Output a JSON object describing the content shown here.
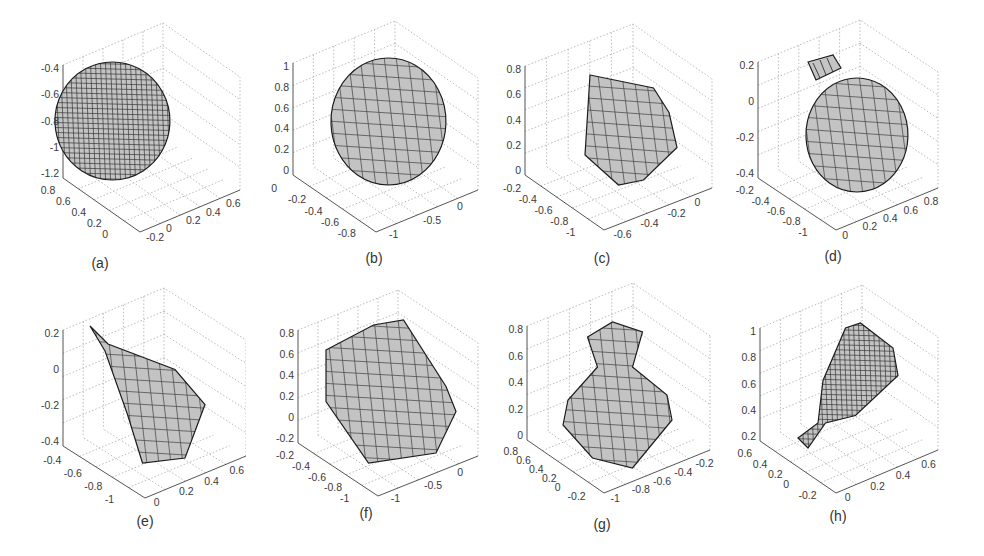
{
  "figure": {
    "panels": [
      {
        "id": "a",
        "caption": "(a)",
        "shape": "dense-wireframe-sphere",
        "z_ticks": [
          "-0.4",
          "-0.6",
          "-0.8",
          "-1",
          "-1.2"
        ],
        "y_ticks": [
          "0.8",
          "0.6",
          "0.4",
          "0.2",
          "0"
        ],
        "x_ticks": [
          "-0.2",
          "0",
          "0.2",
          "0.4",
          "0.6"
        ]
      },
      {
        "id": "b",
        "caption": "(b)",
        "shape": "mesh-sphere",
        "z_ticks": [
          "1",
          "0.8",
          "0.6",
          "0.4",
          "0.2",
          "0"
        ],
        "y_ticks": [
          "0",
          "-0.2",
          "-0.4",
          "-0.6",
          "-0.8"
        ],
        "x_ticks": [
          "-1",
          "-0.5",
          "0"
        ]
      },
      {
        "id": "c",
        "caption": "(c)",
        "shape": "mesh-cone",
        "z_ticks": [
          "0.8",
          "0.6",
          "0.4",
          "0.2",
          "0"
        ],
        "y_ticks": [
          "-0.2",
          "-0.4",
          "-0.6",
          "-0.8",
          "-1"
        ],
        "x_ticks": [
          "-0.6",
          "-0.4",
          "-0.2",
          "0"
        ]
      },
      {
        "id": "d",
        "caption": "(d)",
        "shape": "mesh-egg-detached-cap",
        "z_ticks": [
          "0.2",
          "0",
          "-0.2",
          "-0.4"
        ],
        "y_ticks": [
          "-0.2",
          "-0.4",
          "-0.6",
          "-0.8",
          "-1"
        ],
        "x_ticks": [
          "0",
          "0.2",
          "0.4",
          "0.6",
          "0.8"
        ]
      },
      {
        "id": "e",
        "caption": "(e)",
        "shape": "mesh-teardrop",
        "z_ticks": [
          "0.2",
          "0",
          "-0.2",
          "-0.4"
        ],
        "y_ticks": [
          "-0.4",
          "-0.6",
          "-0.8",
          "-1"
        ],
        "x_ticks": [
          "0",
          "0.2",
          "0.4",
          "0.6"
        ]
      },
      {
        "id": "f",
        "caption": "(f)",
        "shape": "mesh-cylinder",
        "z_ticks": [
          "0.8",
          "0.6",
          "0.4",
          "0.2",
          "0",
          "-0.2"
        ],
        "y_ticks": [
          "-0.2",
          "-0.4",
          "-0.6",
          "-0.8",
          "-1"
        ],
        "x_ticks": [
          "-1",
          "-0.5",
          "0"
        ]
      },
      {
        "id": "g",
        "caption": "(g)",
        "shape": "mesh-vase",
        "z_ticks": [
          "0.8",
          "0.6",
          "0.4",
          "0.2",
          "0"
        ],
        "y_ticks": [
          "0.8",
          "0.6",
          "0.4",
          "0.2",
          "0",
          "-0.2"
        ],
        "x_ticks": [
          "-1",
          "-0.8",
          "-0.6",
          "-0.4",
          "-0.2"
        ]
      },
      {
        "id": "h",
        "caption": "(h)",
        "shape": "wireframe-pear",
        "z_ticks": [
          "1",
          "0.8",
          "0.6",
          "0.4",
          "0.2"
        ],
        "y_ticks": [
          "0.6",
          "0.4",
          "0.2",
          "0",
          "-0.2"
        ],
        "x_ticks": [
          "0",
          "0.2",
          "0.4",
          "0.6"
        ]
      }
    ],
    "colors": {
      "mesh_fill": "#c4c4c4",
      "mesh_edge": "#1e1e1e",
      "axis": "#555555",
      "grid": "#bbbbbb"
    }
  },
  "chart_data": [
    {
      "type": "surface-3d",
      "title": "(a)",
      "zlim": [
        -1.3,
        -0.3
      ],
      "ylim": [
        0,
        0.8
      ],
      "xlim": [
        -0.2,
        0.6
      ],
      "grid": true,
      "ztick_labels": [
        "-0.4",
        "-0.6",
        "-0.8",
        "-1",
        "-1.2"
      ],
      "ytick_labels": [
        "0.8",
        "0.6",
        "0.4",
        "0.2",
        "0"
      ],
      "xtick_labels": [
        "-0.2",
        "0",
        "0.2",
        "0.4",
        "0.6"
      ]
    },
    {
      "type": "surface-3d",
      "title": "(b)",
      "zlim": [
        0,
        1
      ],
      "ylim": [
        -0.9,
        0
      ],
      "xlim": [
        -1,
        0
      ],
      "grid": true,
      "ztick_labels": [
        "1",
        "0.8",
        "0.6",
        "0.4",
        "0.2",
        "0"
      ],
      "ytick_labels": [
        "0",
        "-0.2",
        "-0.4",
        "-0.6",
        "-0.8"
      ],
      "xtick_labels": [
        "-1",
        "-0.5",
        "0"
      ]
    },
    {
      "type": "surface-3d",
      "title": "(c)",
      "zlim": [
        -0.1,
        0.8
      ],
      "ylim": [
        -1,
        -0.2
      ],
      "xlim": [
        -0.7,
        0
      ],
      "grid": true,
      "ztick_labels": [
        "0.8",
        "0.6",
        "0.4",
        "0.2",
        "0"
      ],
      "ytick_labels": [
        "-0.2",
        "-0.4",
        "-0.6",
        "-0.8",
        "-1"
      ],
      "xtick_labels": [
        "-0.6",
        "-0.4",
        "-0.2",
        "0"
      ]
    },
    {
      "type": "surface-3d",
      "title": "(d)",
      "zlim": [
        -0.6,
        0.3
      ],
      "ylim": [
        -1,
        -0.2
      ],
      "xlim": [
        0,
        0.8
      ],
      "grid": true,
      "ztick_labels": [
        "0.2",
        "0",
        "-0.2",
        "-0.4"
      ],
      "ytick_labels": [
        "-0.2",
        "-0.4",
        "-0.6",
        "-0.8",
        "-1"
      ],
      "xtick_labels": [
        "0",
        "0.2",
        "0.4",
        "0.6",
        "0.8"
      ]
    },
    {
      "type": "surface-3d",
      "title": "(e)",
      "zlim": [
        -0.5,
        0.35
      ],
      "ylim": [
        -1,
        -0.4
      ],
      "xlim": [
        0,
        0.6
      ],
      "grid": true,
      "ztick_labels": [
        "0.2",
        "0",
        "-0.2",
        "-0.4"
      ],
      "ytick_labels": [
        "-0.4",
        "-0.6",
        "-0.8",
        "-1"
      ],
      "xtick_labels": [
        "0",
        "0.2",
        "0.4",
        "0.6"
      ]
    },
    {
      "type": "surface-3d",
      "title": "(f)",
      "zlim": [
        -0.3,
        0.8
      ],
      "ylim": [
        -1,
        -0.2
      ],
      "xlim": [
        -1,
        0
      ],
      "grid": true,
      "ztick_labels": [
        "0.8",
        "0.6",
        "0.4",
        "0.2",
        "0",
        "-0.2"
      ],
      "ytick_labels": [
        "-0.2",
        "-0.4",
        "-0.6",
        "-0.8",
        "-1"
      ],
      "xtick_labels": [
        "-1",
        "-0.5",
        "0"
      ]
    },
    {
      "type": "surface-3d",
      "title": "(g)",
      "zlim": [
        -0.1,
        0.95
      ],
      "ylim": [
        -0.2,
        0.8
      ],
      "xlim": [
        -1.1,
        -0.2
      ],
      "grid": true,
      "ztick_labels": [
        "0.8",
        "0.6",
        "0.4",
        "0.2",
        "0"
      ],
      "ytick_labels": [
        "0.8",
        "0.6",
        "0.4",
        "0.2",
        "0",
        "-0.2"
      ],
      "xtick_labels": [
        "-1",
        "-0.8",
        "-0.6",
        "-0.4",
        "-0.2"
      ]
    },
    {
      "type": "surface-3d",
      "title": "(h)",
      "zlim": [
        0.1,
        1
      ],
      "ylim": [
        -0.2,
        0.6
      ],
      "xlim": [
        -0.1,
        0.7
      ],
      "grid": true,
      "ztick_labels": [
        "1",
        "0.8",
        "0.6",
        "0.4",
        "0.2"
      ],
      "ytick_labels": [
        "0.6",
        "0.4",
        "0.2",
        "0",
        "-0.2"
      ],
      "xtick_labels": [
        "0",
        "0.2",
        "0.4",
        "0.6"
      ]
    }
  ]
}
